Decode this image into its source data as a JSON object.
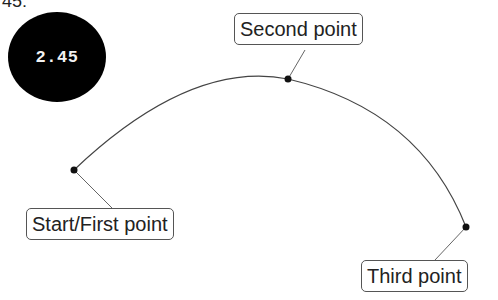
{
  "top_fragment": "45:",
  "badge": {
    "value": "2.45"
  },
  "arc": {
    "stroke": "#444444"
  },
  "points": [
    {
      "label": "Start/First point",
      "x": 74,
      "y": 170
    },
    {
      "label": "Second point",
      "x": 288,
      "y": 79
    },
    {
      "label": "Third point",
      "x": 466,
      "y": 227
    }
  ]
}
